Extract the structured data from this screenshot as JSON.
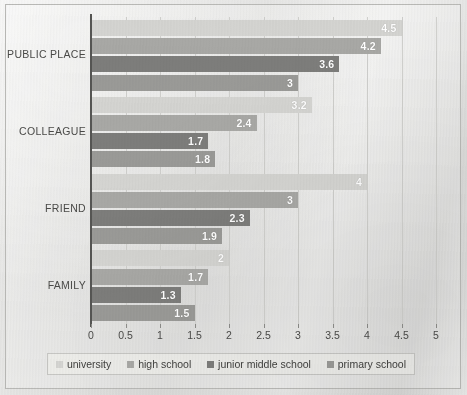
{
  "chart_data": {
    "type": "bar",
    "orientation": "horizontal",
    "title": "",
    "xlabel": "",
    "ylabel": "",
    "xlim": [
      0,
      5
    ],
    "xticks": [
      "0",
      "0.5",
      "1",
      "1.5",
      "2",
      "2.5",
      "3",
      "3.5",
      "4",
      "4.5",
      "5"
    ],
    "xtick_values": [
      0,
      0.5,
      1,
      1.5,
      2,
      2.5,
      3,
      3.5,
      4,
      4.5,
      5
    ],
    "grid": true,
    "grid_axis": "x",
    "legend_position": "bottom",
    "categories": [
      "PUBLIC PLACE",
      "COLLEAGUE",
      "FRIEND",
      "FAMILY"
    ],
    "series": [
      {
        "name": "university",
        "color": "#d4d4d1",
        "values": [
          4.5,
          3.2,
          4,
          2
        ],
        "labels": [
          "4.5",
          "3.2",
          "4",
          "2"
        ]
      },
      {
        "name": "high school",
        "color": "#a8a8a5",
        "values": [
          4.2,
          2.4,
          3,
          1.7
        ],
        "labels": [
          "4.2",
          "2.4",
          "3",
          "1.7"
        ]
      },
      {
        "name": "junior middle school",
        "color": "#7d7d7b",
        "values": [
          3.6,
          1.7,
          2.3,
          1.3
        ],
        "labels": [
          "3.6",
          "1.7",
          "2.3",
          "1.3"
        ]
      },
      {
        "name": "primary school",
        "color": "#9a9a97",
        "values": [
          3,
          1.8,
          1.9,
          1.5
        ],
        "labels": [
          "3",
          "1.8",
          "1.9",
          "1.5"
        ]
      }
    ]
  },
  "legend": {
    "items": [
      {
        "label": "university",
        "color": "#d4d4d1"
      },
      {
        "label": "high school",
        "color": "#a8a8a5"
      },
      {
        "label": "junior middle school",
        "color": "#7d7d7b"
      },
      {
        "label": "primary school",
        "color": "#9a9a97"
      }
    ]
  },
  "axis": {
    "y_labels": [
      "PUBLIC PLACE",
      "COLLEAGUE",
      "FRIEND",
      "FAMILY"
    ],
    "x_labels": [
      "0",
      "0.5",
      "1",
      "1.5",
      "2",
      "2.5",
      "3",
      "3.5",
      "4",
      "4.5",
      "5"
    ]
  },
  "colors": {
    "background": "#e6e6e4",
    "border": "#b9b9b6",
    "axis_line": "#555553",
    "gridline": "#cfcfcc",
    "text": "#4a4a48",
    "value_text": "#ffffff"
  }
}
